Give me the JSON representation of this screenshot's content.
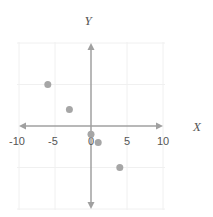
{
  "chart_data": {
    "type": "scatter",
    "title": "",
    "xlabel": "X",
    "ylabel": "Y",
    "xlim": [
      -10,
      10
    ],
    "ylim": [
      -10,
      10
    ],
    "grid": true,
    "x_ticks": [
      "-10",
      "-5",
      "0",
      "5",
      "10"
    ],
    "series": [
      {
        "name": "points",
        "color": "#a6a6a6",
        "points": [
          {
            "x": -6,
            "y": 5
          },
          {
            "x": -3,
            "y": 2
          },
          {
            "x": 0,
            "y": -1
          },
          {
            "x": 1,
            "y": -2
          },
          {
            "x": 4,
            "y": -5
          }
        ]
      }
    ]
  },
  "colors": {
    "axis": "#a0a0a0",
    "grid": "#f0f0f0",
    "point": "#a6a6a6",
    "text": "#555555"
  }
}
